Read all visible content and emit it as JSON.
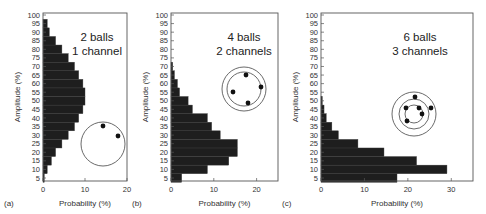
{
  "chart_data": [
    {
      "type": "bar",
      "orientation": "horizontal",
      "panel_label": "(a)",
      "title_lines": [
        "2 balls",
        "1 channel"
      ],
      "xlabel": "Probability (%)",
      "ylabel": "Amplitude (%)",
      "xlim": [
        0,
        20
      ],
      "xticks": [
        0,
        10,
        20
      ],
      "ylim": [
        0,
        100
      ],
      "yticks": [
        5,
        10,
        15,
        20,
        25,
        30,
        35,
        40,
        45,
        50,
        55,
        60,
        65,
        70,
        75,
        80,
        85,
        90,
        95,
        100
      ],
      "categories": [
        5,
        10,
        15,
        20,
        25,
        30,
        35,
        40,
        45,
        50,
        55,
        60,
        65,
        70,
        75,
        80,
        85,
        90,
        95
      ],
      "values": [
        0.3,
        1,
        2,
        3,
        4.5,
        6,
        7.5,
        8.5,
        9.5,
        10,
        10,
        9.5,
        8.5,
        7.5,
        6,
        4.5,
        3,
        1.5,
        1
      ],
      "diagram": {
        "rings": 1,
        "balls": 2
      }
    },
    {
      "type": "bar",
      "orientation": "horizontal",
      "panel_label": "(b)",
      "title_lines": [
        "4 balls",
        "2 channels"
      ],
      "xlabel": "Probability (%)",
      "ylabel": "Amplitude (%)",
      "xlim": [
        0,
        25
      ],
      "xticks": [
        0,
        10,
        20
      ],
      "ylim": [
        0,
        100
      ],
      "yticks": [
        5,
        10,
        15,
        20,
        25,
        30,
        35,
        40,
        45,
        50,
        55,
        60,
        65,
        70,
        75,
        80,
        85,
        90,
        95,
        100
      ],
      "categories": [
        5,
        10,
        15,
        20,
        25,
        30,
        35,
        40,
        45,
        50,
        55,
        60,
        65,
        70
      ],
      "values": [
        2.5,
        8.5,
        13.5,
        15.5,
        15.5,
        11.5,
        9.5,
        8.5,
        5,
        4,
        2,
        1.5,
        0.8,
        0.4
      ],
      "diagram": {
        "rings": 2,
        "balls": 4
      }
    },
    {
      "type": "bar",
      "orientation": "horizontal",
      "panel_label": "(c)",
      "title_lines": [
        "6 balls",
        "3 channels"
      ],
      "xlabel": "Probability (%)",
      "ylabel": "Amplitude (%)",
      "xlim": [
        0,
        35
      ],
      "xticks": [
        0,
        10,
        20,
        30
      ],
      "ylim": [
        0,
        100
      ],
      "yticks": [
        5,
        10,
        15,
        20,
        25,
        30,
        35,
        40,
        45,
        50,
        55,
        60,
        65,
        70,
        75,
        80,
        85,
        90,
        95,
        100
      ],
      "categories": [
        5,
        10,
        15,
        20,
        25,
        30,
        35,
        40,
        45,
        50
      ],
      "values": [
        17.5,
        29,
        22,
        14.5,
        8.5,
        4,
        2.5,
        1.2,
        0.7,
        0.3
      ],
      "diagram": {
        "rings": 3,
        "balls": 6
      }
    }
  ],
  "colors": {
    "bar": "#1e1e1e",
    "axis": "#555555",
    "text": "#333333"
  },
  "layout": [
    {
      "x0": 43,
      "x1": 127,
      "xmax": 20,
      "circle": {
        "cx": 103,
        "cy": 144,
        "r": [
          22
        ]
      },
      "dots": [
        [
          103,
          126
        ],
        [
          118,
          136
        ]
      ],
      "title_x": 97
    },
    {
      "x0": 171,
      "x1": 278,
      "xmax": 25,
      "circle": {
        "cx": 244,
        "cy": 89,
        "r": [
          22,
          17
        ]
      },
      "dots": [
        [
          246,
          75
        ],
        [
          261,
          87
        ],
        [
          233,
          92
        ],
        [
          248,
          103
        ]
      ],
      "title_x": 244
    },
    {
      "x0": 321,
      "x1": 473,
      "xmax": 35,
      "circle": {
        "cx": 414,
        "cy": 114,
        "r": [
          22,
          15,
          9
        ]
      },
      "dots": [
        [
          415,
          97
        ],
        [
          406,
          108
        ],
        [
          431,
          108
        ],
        [
          419,
          108
        ],
        [
          422,
          114
        ],
        [
          407,
          121
        ]
      ],
      "title_x": 420
    }
  ]
}
